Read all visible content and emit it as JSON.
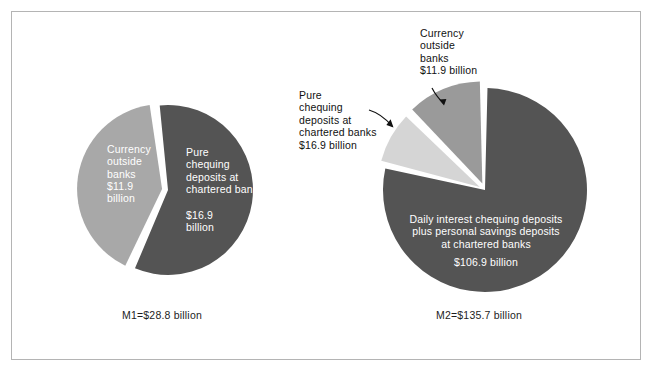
{
  "figure": {
    "border_color": "#b4b4b4",
    "background": "#ffffff"
  },
  "charts": {
    "left": {
      "caption": "M1=$28.8 billion",
      "labels": {
        "currency_name": "Currency\noutside\nbanks",
        "currency_amount": "$11.9\nbillion",
        "pure_name": "Pure\nchequing\ndeposits at\nchartered banks",
        "pure_amount": "$16.9\nbillion"
      }
    },
    "right": {
      "caption": "M2=$135.7 billion",
      "labels": {
        "daily_name": "Daily interest chequing deposits\nplus personal savings deposits\nat chartered banks",
        "daily_amount": "$106.9 billion",
        "pure_name": "Pure\nchequing\ndeposits at\nchartered banks",
        "pure_amount": "$16.9 billion",
        "currency_name": "Currency\noutside\nbanks",
        "currency_amount": "$11.9 billion"
      }
    }
  },
  "chart_data": [
    {
      "type": "pie",
      "title": "M1=$28.8 billion",
      "unit": "billion CAD",
      "total": 28.8,
      "categories": [
        "Currency outside banks",
        "Pure chequing deposits at chartered banks"
      ],
      "values": [
        11.9,
        16.9
      ],
      "percentages": [
        41.3,
        58.7
      ],
      "colors": [
        "#a8a8a8",
        "#545454"
      ],
      "exploded": true,
      "legend": "none",
      "labels_inside": true
    },
    {
      "type": "pie",
      "title": "M2=$135.7 billion",
      "unit": "billion CAD",
      "total": 135.7,
      "categories": [
        "Daily interest chequing deposits plus personal savings deposits at chartered banks",
        "Currency outside banks",
        "Pure chequing deposits at chartered banks"
      ],
      "values": [
        106.9,
        11.9,
        16.9
      ],
      "percentages": [
        78.8,
        8.8,
        12.5
      ],
      "colors": [
        "#545454",
        "#d5d5d5",
        "#9a9a9a"
      ],
      "exploded": true,
      "legend": "none",
      "labels_inside": false
    }
  ]
}
